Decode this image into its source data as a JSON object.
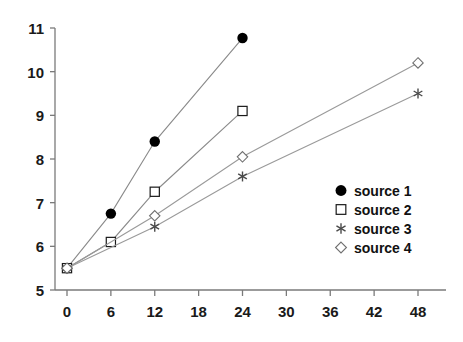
{
  "chart_data": {
    "type": "line",
    "title": "",
    "subtitle": "",
    "xlabel": "",
    "ylabel": "",
    "xlim": [
      -1.5,
      54
    ],
    "ylim": [
      5,
      11
    ],
    "xticks": [
      0,
      6,
      12,
      18,
      24,
      30,
      36,
      42,
      48
    ],
    "yticks": [
      5,
      6,
      7,
      8,
      9,
      10,
      11
    ],
    "xtick_labels": [
      "0",
      "6",
      "12",
      "18",
      "24",
      "30",
      "36",
      "42",
      "48"
    ],
    "ytick_labels": [
      "5",
      "6",
      "7",
      "8",
      "9",
      "10",
      "11"
    ],
    "grid": false,
    "legend_position": "right-middle",
    "series": [
      {
        "name": "source 1",
        "marker": "filled-circle",
        "color": "#000000",
        "line_color": "#8a8a8a",
        "x": [
          0,
          6,
          12,
          24
        ],
        "y": [
          5.5,
          6.75,
          8.4,
          10.77
        ]
      },
      {
        "name": "source 2",
        "marker": "open-square",
        "color": "#000000",
        "line_color": "#8a8a8a",
        "x": [
          0,
          6,
          12,
          24
        ],
        "y": [
          5.5,
          6.1,
          7.25,
          9.1
        ]
      },
      {
        "name": "source 3",
        "marker": "asterisk",
        "color": "#555555",
        "line_color": "#9a9a9a",
        "x": [
          0,
          12,
          24,
          48
        ],
        "y": [
          5.5,
          6.45,
          7.6,
          9.5
        ]
      },
      {
        "name": "source 4",
        "marker": "open-diamond",
        "color": "#777777",
        "line_color": "#9a9a9a",
        "x": [
          0,
          12,
          24,
          48
        ],
        "y": [
          5.5,
          6.7,
          8.05,
          10.2
        ]
      }
    ]
  },
  "legend": {
    "items": [
      {
        "label": "source 1",
        "marker": "filled-circle-icon"
      },
      {
        "label": "source 2",
        "marker": "open-square-icon"
      },
      {
        "label": "source 3",
        "marker": "asterisk-icon"
      },
      {
        "label": "source 4",
        "marker": "open-diamond-icon"
      }
    ]
  },
  "axes": {
    "y_labels": [
      "11",
      "10",
      "9",
      "8",
      "7",
      "6",
      "5"
    ],
    "x_labels": [
      "0",
      "6",
      "12",
      "18",
      "24",
      "30",
      "36",
      "42",
      "48"
    ]
  }
}
